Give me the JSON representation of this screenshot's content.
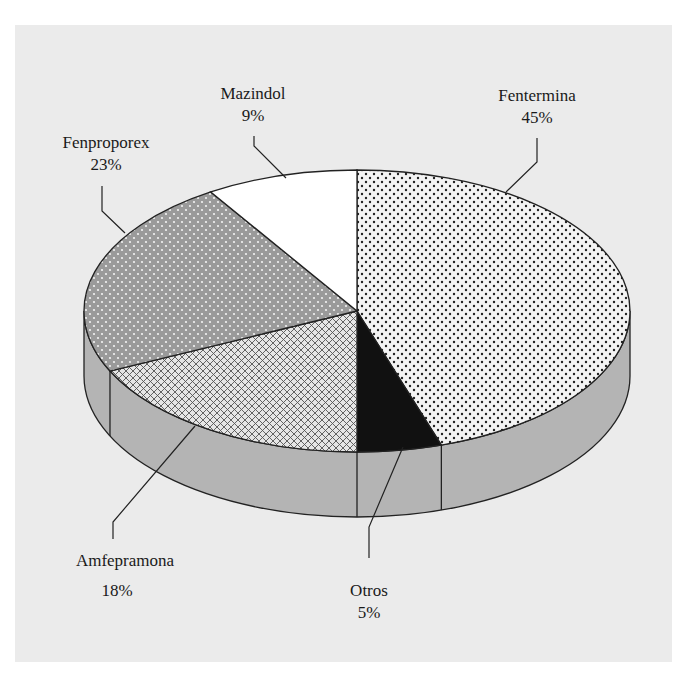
{
  "chart_data": {
    "type": "pie",
    "style": "3d-exploded-none",
    "title": "",
    "slices": [
      {
        "label": "Fentermina",
        "value": 45,
        "pct_text": "45%",
        "pattern": "black-dots-on-white"
      },
      {
        "label": "Otros",
        "value": 5,
        "pct_text": "5%",
        "pattern": "solid-black"
      },
      {
        "label": "Amfepramona",
        "value": 18,
        "pct_text": "18%",
        "pattern": "crosshatch"
      },
      {
        "label": "Fenproporex",
        "value": 23,
        "pct_text": "23%",
        "pattern": "white-dots-on-gray"
      },
      {
        "label": "Mazindol",
        "value": 9,
        "pct_text": "9%",
        "pattern": "solid-white"
      }
    ],
    "legend": "none (direct leader-line labels)",
    "colors": {
      "background_panel": "#ebebeb",
      "side_wall": "#b4b4b4",
      "outline": "#222222",
      "gray_slice": "#999999"
    }
  },
  "labels": {
    "fentermina": {
      "name": "Fentermina",
      "pct": "45%"
    },
    "mazindol": {
      "name": "Mazindol",
      "pct": "9%"
    },
    "fenproporex": {
      "name": "Fenproporex",
      "pct": "23%"
    },
    "amfepramona": {
      "name": "Amfepramona",
      "pct": "18%"
    },
    "otros": {
      "name": "Otros",
      "pct": "5%"
    }
  }
}
